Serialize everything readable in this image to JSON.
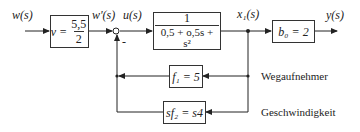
{
  "signals": {
    "input": "w(s)",
    "scaled_input": "w'(s)",
    "control": "u(s)",
    "state": "x₁(s)",
    "output": "y(s)"
  },
  "blocks": {
    "prefilter": {
      "lhs": "v =",
      "num": "5,5",
      "den": "2"
    },
    "plant": {
      "num": "1",
      "den": "0,5 + o,5s + s²"
    },
    "output_gain": {
      "text": "b₀ = 2"
    },
    "feedback_position": {
      "text": "f₁ = 5"
    },
    "feedback_velocity": {
      "text": "sf₂ = s4"
    }
  },
  "summing_junction": {
    "sign": "-"
  },
  "feedback_labels": {
    "position_sensor": "Wegaufnehmer",
    "velocity": "Geschwindigkeit"
  }
}
